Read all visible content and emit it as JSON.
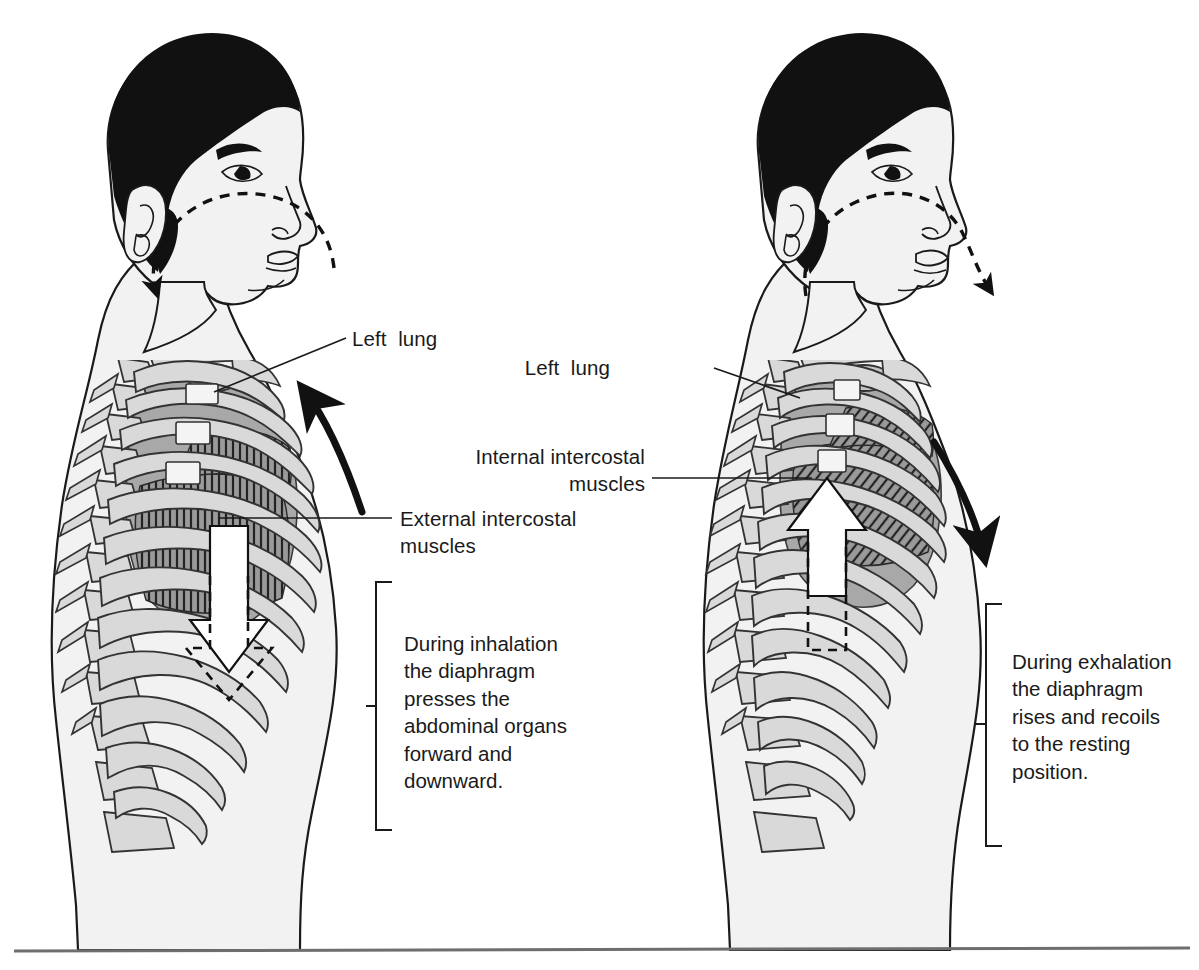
{
  "figure": {
    "kind": "anatomical-diagram",
    "panels": [
      {
        "id": "inhalation",
        "side": "left",
        "labels": [
          {
            "name": "left-lung",
            "text": "Left  lung"
          },
          {
            "name": "external-intercostal-muscles",
            "text": "External intercostal\nmuscles"
          }
        ],
        "caption": "During inhalation\nthe diaphragm\npresses the\nabdominal organs\nforward and\ndownward.",
        "airflow_arrow": "dashed arrow curving inward through the nose and mouth (air in)",
        "diaphragm_arrow": "white block arrow pointing down",
        "ribcage_arrow": "black curved arrow sweeping upward and outward"
      },
      {
        "id": "exhalation",
        "side": "right",
        "labels": [
          {
            "name": "left-lung",
            "text": "Left  lung"
          },
          {
            "name": "internal-intercostal-muscles",
            "text": "Internal intercostal\nmuscles"
          }
        ],
        "caption": "During exhalation\nthe diaphragm\nrises and recoils\nto the resting\nposition.",
        "airflow_arrow": "dashed arrow curving outward from the mouth (air out)",
        "diaphragm_arrow": "white block arrow pointing up",
        "ribcage_arrow": "black curved arrow sweeping downward and inward"
      }
    ]
  },
  "colors": {
    "background": "#ffffff",
    "body_fill": "#f2f2f2",
    "body_outline": "#1a1a1a",
    "hair_fill": "#111111",
    "bone_fill": "#d9d9d9",
    "bone_outline": "#333333",
    "lung_fill": "#a8a8a8",
    "muscle_fill": "#9a9a9a",
    "text": "#1a1a1a",
    "rule": "#6e6e6e"
  }
}
